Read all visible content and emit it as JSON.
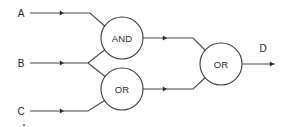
{
  "diagram": {
    "width": 285,
    "height": 127,
    "background_color": "#ffffff",
    "wire_color": "#4a4a4a",
    "gate_outline_color": "#3a3a3a",
    "text_color": "#1c1c1c"
  },
  "inputs": [
    {
      "id": "A",
      "label": "A",
      "label_x": 21,
      "label_y": 13,
      "wire_y": 13
    },
    {
      "id": "B",
      "label": "B",
      "label_x": 21,
      "label_y": 63,
      "wire_y": 63
    },
    {
      "id": "C",
      "label": "C",
      "label_x": 21,
      "label_y": 111,
      "wire_y": 111
    }
  ],
  "outputs": [
    {
      "id": "D",
      "label": "D",
      "label_x": 263,
      "label_y": 48,
      "wire_y": 64
    }
  ],
  "gates": [
    {
      "id": "gate-and",
      "type": "AND",
      "label": "AND",
      "cx": 122,
      "cy": 38,
      "r": 21,
      "inputs": [
        "A",
        "B"
      ],
      "output": "and_out"
    },
    {
      "id": "gate-or-lower",
      "type": "OR",
      "label": "OR",
      "cx": 122,
      "cy": 89,
      "r": 21,
      "inputs": [
        "B",
        "C"
      ],
      "output": "or_lower_out"
    },
    {
      "id": "gate-or-output",
      "type": "OR",
      "label": "OR",
      "cx": 221,
      "cy": 64,
      "r": 21,
      "inputs": [
        "and_out",
        "or_lower_out"
      ],
      "output": "D"
    }
  ],
  "wires": [
    {
      "id": "wire-a",
      "from": "A",
      "to": "gate-and",
      "path": "M 30 13 L 90 13 L 107 28"
    },
    {
      "id": "wire-b",
      "from": "B",
      "to": "split-b",
      "path": "M 30 63 L 88 63"
    },
    {
      "id": "wire-b-to-and",
      "from": "split-b",
      "to": "gate-and",
      "path": "M 88 63 L 107 48"
    },
    {
      "id": "wire-b-to-or",
      "from": "split-b",
      "to": "gate-or-lower",
      "path": "M 88 63 L 107 78"
    },
    {
      "id": "wire-c",
      "from": "C",
      "to": "gate-or-lower",
      "path": "M 30 111 L 88 111 L 107 99"
    },
    {
      "id": "wire-and-out",
      "from": "gate-and",
      "to": "gate-or-output",
      "path": "M 143 38 L 193 38 L 207 52"
    },
    {
      "id": "wire-or-lower-out",
      "from": "gate-or-lower",
      "to": "gate-or-output",
      "path": "M 143 89 L 193 89 L 207 76"
    },
    {
      "id": "wire-d-out",
      "from": "gate-or-output",
      "to": "D",
      "path": "M 242 64 L 275 64"
    }
  ],
  "arrow_markers": [
    {
      "id": "arrow-a-input",
      "x": 64,
      "y": 13
    },
    {
      "id": "arrow-b-input",
      "x": 64,
      "y": 63
    },
    {
      "id": "arrow-c-input",
      "x": 64,
      "y": 111
    },
    {
      "id": "arrow-and-out",
      "x": 167,
      "y": 38
    },
    {
      "id": "arrow-or-lower-out",
      "x": 167,
      "y": 89
    },
    {
      "id": "arrow-d-out",
      "x": 274,
      "y": 64
    }
  ],
  "artifacts": [
    {
      "id": "speck-below-c",
      "x": 24,
      "y": 125,
      "r": 1.2
    }
  ],
  "logic": {
    "expression": "D = (A AND B) OR (B OR C)"
  }
}
